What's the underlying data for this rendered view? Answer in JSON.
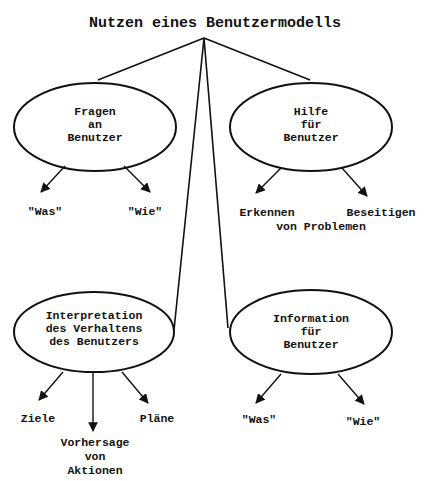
{
  "title": "Nutzen eines Benutzermodells",
  "nodes": {
    "fragen": {
      "lines": [
        "Fragen",
        "an",
        "Benutzer"
      ],
      "children": [
        "\"Was\"",
        "\"Wie\""
      ]
    },
    "hilfe": {
      "lines": [
        "Hilfe",
        "für",
        "Benutzer"
      ],
      "children": [
        "Erkennen",
        "Beseitigen"
      ],
      "shared_label": "von Problemen"
    },
    "interpretation": {
      "lines": [
        "Interpretation",
        "des Verhaltens",
        "des Benutzers"
      ],
      "children": [
        "Ziele",
        "Pläne"
      ],
      "center_child": [
        "Vorhersage",
        "von",
        "Aktionen"
      ]
    },
    "information": {
      "lines": [
        "Information",
        "für",
        "Benutzer"
      ],
      "children": [
        "\"Was\"",
        "\"Wie\""
      ]
    }
  },
  "colors": {
    "stroke": "#111111",
    "background": "#ffffff"
  }
}
